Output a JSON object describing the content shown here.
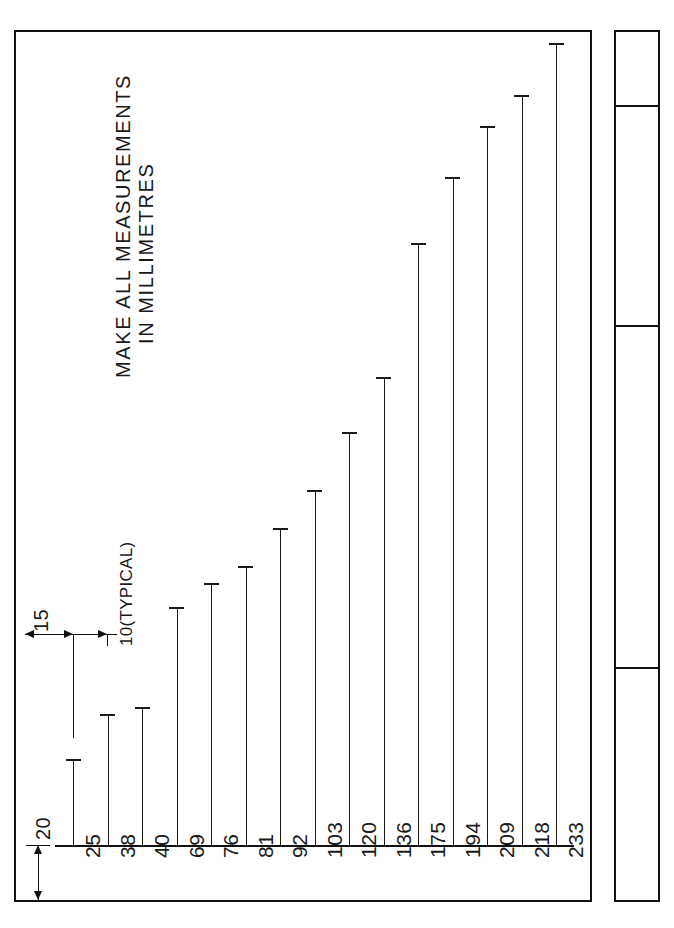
{
  "drawing": {
    "note": {
      "line1": "MAKE ALL MEASUREMENTS",
      "line2": "IN MILLIMETRES"
    },
    "dimensions": {
      "edge_offset": "15",
      "bar_spacing": "10(TYPICAL)",
      "baseline_offset": "20"
    }
  },
  "title_block": {
    "cells": [
      {
        "name": "cell-1",
        "text": ""
      },
      {
        "name": "cell-2",
        "text": ""
      },
      {
        "name": "cell-3",
        "text": ""
      },
      {
        "name": "cell-4",
        "text": ""
      }
    ]
  },
  "chart_data": {
    "type": "bar",
    "title": "",
    "subtitle": "",
    "xlabel": "",
    "ylabel": "",
    "units": "millimetres",
    "orientation": "vertical",
    "grid": false,
    "legend": null,
    "categories": [
      "25",
      "38",
      "40",
      "69",
      "76",
      "81",
      "92",
      "103",
      "120",
      "136",
      "175",
      "194",
      "209",
      "218",
      "233"
    ],
    "values": [
      25,
      38,
      40,
      69,
      76,
      81,
      92,
      103,
      120,
      136,
      175,
      194,
      209,
      218,
      233
    ],
    "ylim": [
      0,
      233
    ],
    "annotations": [
      {
        "label": "15",
        "meaning": "distance from left frame edge to first bar"
      },
      {
        "label": "10(TYPICAL)",
        "meaning": "typical centre-to-centre bar spacing"
      },
      {
        "label": "20",
        "meaning": "distance from baseline down to bottom frame edge"
      }
    ]
  }
}
